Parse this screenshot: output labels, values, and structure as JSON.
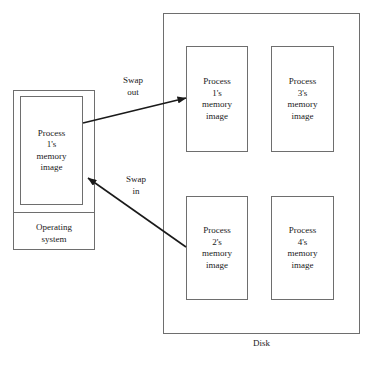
{
  "diagram": {
    "stroke_color": "#6e6e6e",
    "text_color": "#1a1a1a",
    "background": "#ffffff"
  },
  "memory": {
    "process_image_label": "Process\n1's\nmemory\nimage",
    "os_label": "Operating\nsystem"
  },
  "disk": {
    "label": "Disk",
    "slots": [
      {
        "id": "process-1",
        "label": "Process\n1's\nmemory\nimage"
      },
      {
        "id": "process-3",
        "label": "Process\n3's\nmemory\nimage"
      },
      {
        "id": "process-2",
        "label": "Process\n2's\nmemory\nimage"
      },
      {
        "id": "process-4",
        "label": "Process\n4's\nmemory\nimage"
      }
    ]
  },
  "arrows": [
    {
      "id": "swap-out",
      "label": "Swap\nout",
      "from": {
        "x": 83,
        "y": 123
      },
      "to": {
        "x": 186,
        "y": 98
      },
      "direction": "memory-to-disk"
    },
    {
      "id": "swap-in",
      "label": "Swap\nin",
      "from": {
        "x": 186,
        "y": 247
      },
      "to": {
        "x": 88,
        "y": 178
      },
      "direction": "disk-to-memory"
    }
  ]
}
